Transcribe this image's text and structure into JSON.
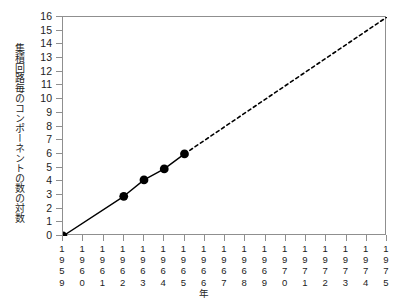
{
  "chart_data": {
    "type": "line",
    "title": "",
    "subtitle": "",
    "xlabel": "年",
    "ylabel": "集積回路毎のコンポーネントの数の対数",
    "xlim": [
      1959,
      1975
    ],
    "ylim": [
      0,
      16
    ],
    "grid": false,
    "legend": "none",
    "x_tick_labels": [
      "1959",
      "1960",
      "1961",
      "1962",
      "1963",
      "1964",
      "1965",
      "1966",
      "1967",
      "1968",
      "1969",
      "1970",
      "1971",
      "1972",
      "1973",
      "1974",
      "1975"
    ],
    "y_tick_labels": [
      "0",
      "1",
      "2",
      "3",
      "4",
      "5",
      "6",
      "7",
      "8",
      "9",
      "10",
      "11",
      "12",
      "13",
      "14",
      "15",
      "16"
    ],
    "series": [
      {
        "name": "観測値",
        "style": "solid-with-markers",
        "color": "#000000",
        "x": [
          1959,
          1962,
          1963,
          1964,
          1965
        ],
        "values": [
          0,
          2.9,
          4.1,
          4.9,
          6.0
        ]
      },
      {
        "name": "外挿",
        "style": "dashed",
        "color": "#000000",
        "x": [
          1965,
          1975
        ],
        "values": [
          6.0,
          16
        ]
      }
    ]
  },
  "axes": {
    "y_title": "集積回路毎のコンポーネントの数の対数",
    "x_unit_label": "年"
  },
  "colors": {
    "axis": "#8f8f8f",
    "line": "#000000",
    "marker": "#000000",
    "text": "#1c1c1c",
    "background": "#ffffff"
  }
}
